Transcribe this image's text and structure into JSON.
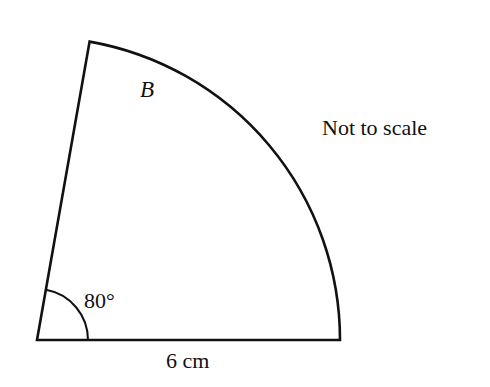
{
  "figure": {
    "sector_label": "B",
    "angle_label": "80°",
    "radius_label": "6 cm",
    "note": "Not to scale",
    "angle_degrees": 80,
    "radius_cm": 6
  }
}
